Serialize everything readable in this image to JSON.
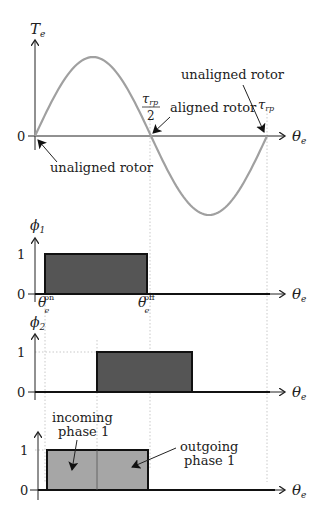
{
  "diagram": {
    "torque_plot": {
      "y_axis_label": "T",
      "y_axis_sub": "e",
      "x_axis_label": "θ",
      "x_axis_sub": "e",
      "zero_tick": "0",
      "tau_half_num": "τ",
      "tau_half_num_sub": "rp",
      "tau_half_den": "2",
      "tau_label": "τ",
      "tau_label_sub": "rp",
      "annotations": {
        "unaligned_start": "unaligned rotor",
        "aligned": "aligned rotor",
        "unaligned_end": "unaligned rotor"
      },
      "curve": "sine, one full period from 0 to τrp",
      "curve_color": "#a0a0a0"
    },
    "phase1_plot": {
      "y_axis_label": "ϕ",
      "y_axis_sub": "1",
      "tick_one": "1",
      "tick_zero": "0",
      "x_axis_label": "θ",
      "x_axis_sub": "e",
      "theta_on": "θ",
      "theta_on_sub": "e",
      "theta_on_sup": "on",
      "theta_off": "θ",
      "theta_off_sub": "e",
      "theta_off_sup": "off",
      "pulse_fill": "#555555"
    },
    "phase2_plot": {
      "y_axis_label": "ϕ",
      "y_axis_sub": "2",
      "tick_one": "1",
      "tick_zero": "0",
      "x_axis_label": "θ",
      "x_axis_sub": "e",
      "pulse_fill": "#555555"
    },
    "combined_plot": {
      "tick_one": "1",
      "tick_zero": "0",
      "x_axis_label": "θ",
      "x_axis_sub": "e",
      "incoming_line1": "incoming",
      "incoming_line2": "phase 1",
      "outgoing_line1": "outgoing",
      "outgoing_line2": "phase 1",
      "pulse_fill": "#a6a6a6"
    }
  }
}
